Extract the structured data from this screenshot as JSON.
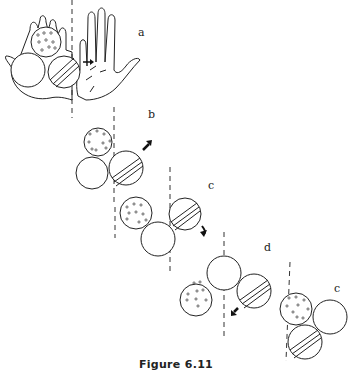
{
  "figure": {
    "caption": "Figure 6.11",
    "panels": [
      {
        "label": "a",
        "description": "Three balls held in a hand: dotted ball on top, plain ball lower left, striped ball lower right with arrow pointing right"
      },
      {
        "label": "b",
        "description": "Dotted ball top, plain ball bottom left, striped ball right with arrow pointing up-right"
      },
      {
        "label": "c",
        "description": "Dotted ball left, plain ball bottom, striped ball right with curved arrow down-right"
      },
      {
        "label": "d",
        "description": "Dotted ball left, plain ball top center, striped ball right with arrow pointing down-left"
      },
      {
        "label": "c",
        "description": "Dotted ball top, plain ball right, striped ball bottom"
      }
    ],
    "legend": {
      "dotted": "ball with small circles",
      "striped": "ball with diagonal stripes",
      "plain": "empty ball"
    }
  }
}
